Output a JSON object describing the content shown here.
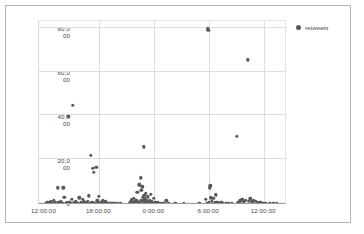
{
  "legend": {
    "position": "right",
    "series_label": "retweets",
    "marker_color": "#585858"
  },
  "axes": {
    "y_ticks": [
      {
        "value": 80000,
        "line1": "80,0",
        "line2": "00"
      },
      {
        "value": 60000,
        "line1": "60,0",
        "line2": "00"
      },
      {
        "value": 40000,
        "line1": "40,0",
        "line2": "00"
      },
      {
        "value": 20000,
        "line1": "20,0",
        "line2": "00"
      },
      {
        "value": 0,
        "line1": "0",
        "line2": ""
      }
    ],
    "x_ticks": [
      {
        "label": "12:00:00",
        "hours": 0
      },
      {
        "label": "18:00:00",
        "hours": 6
      },
      {
        "label": "0:00:00",
        "hours": 12
      },
      {
        "label": "6:00:00",
        "hours": 18
      },
      {
        "label": "12:00:00",
        "hours": 24
      }
    ]
  },
  "chart_data": {
    "type": "scatter",
    "title": "",
    "xlabel": "",
    "ylabel": "",
    "xlim": [
      -0.6,
      26.5
    ],
    "ylim": [
      0,
      84000
    ],
    "grid": true,
    "legend_position": "right",
    "series": [
      {
        "name": "retweets",
        "color": "#585858",
        "points": [
          [
            0.15,
            700
          ],
          [
            0.3,
            900
          ],
          [
            0.45,
            1200
          ],
          [
            0.55,
            600
          ],
          [
            0.7,
            1500
          ],
          [
            0.85,
            800
          ],
          [
            0.95,
            500
          ],
          [
            1.05,
            2000
          ],
          [
            1.15,
            1100
          ],
          [
            1.3,
            700
          ],
          [
            1.45,
            7800
          ],
          [
            1.5,
            900
          ],
          [
            1.65,
            600
          ],
          [
            1.8,
            1400
          ],
          [
            1.95,
            800
          ],
          [
            2.05,
            7800
          ],
          [
            2.15,
            3400
          ],
          [
            2.3,
            600
          ],
          [
            2.45,
            900
          ],
          [
            2.6,
            40500
          ],
          [
            2.7,
            1200
          ],
          [
            2.85,
            700
          ],
          [
            3.0,
            2600
          ],
          [
            3.1,
            45500
          ],
          [
            3.25,
            900
          ],
          [
            3.4,
            1600
          ],
          [
            3.5,
            600
          ],
          [
            3.65,
            800
          ],
          [
            3.8,
            3200
          ],
          [
            3.95,
            1100
          ],
          [
            4.05,
            700
          ],
          [
            4.2,
            2400
          ],
          [
            4.3,
            1300
          ],
          [
            4.45,
            900
          ],
          [
            4.55,
            600
          ],
          [
            4.7,
            1500
          ],
          [
            4.85,
            4200
          ],
          [
            4.95,
            800
          ],
          [
            5.05,
            22600
          ],
          [
            5.15,
            1200
          ],
          [
            5.25,
            16600
          ],
          [
            5.3,
            900
          ],
          [
            5.4,
            14800
          ],
          [
            5.5,
            700
          ],
          [
            5.65,
            17200
          ],
          [
            5.75,
            1900
          ],
          [
            5.85,
            1100
          ],
          [
            5.95,
            3800
          ],
          [
            6.05,
            700
          ],
          [
            6.2,
            900
          ],
          [
            6.35,
            2200
          ],
          [
            6.5,
            600
          ],
          [
            6.65,
            1300
          ],
          [
            6.8,
            800
          ],
          [
            6.95,
            500
          ],
          [
            7.1,
            700
          ],
          [
            7.3,
            400
          ],
          [
            7.5,
            600
          ],
          [
            7.7,
            450
          ],
          [
            7.9,
            500
          ],
          [
            8.1,
            350
          ],
          [
            8.3,
            400
          ],
          [
            9.3,
            900
          ],
          [
            9.45,
            1700
          ],
          [
            9.55,
            2300
          ],
          [
            9.65,
            1100
          ],
          [
            9.75,
            3100
          ],
          [
            9.85,
            1400
          ],
          [
            9.95,
            800
          ],
          [
            10.05,
            2000
          ],
          [
            10.15,
            5600
          ],
          [
            10.25,
            1200
          ],
          [
            10.35,
            9200
          ],
          [
            10.4,
            700
          ],
          [
            10.5,
            12400
          ],
          [
            10.55,
            2100
          ],
          [
            10.6,
            6500
          ],
          [
            10.65,
            1500
          ],
          [
            10.7,
            8200
          ],
          [
            10.75,
            3300
          ],
          [
            10.8,
            1900
          ],
          [
            10.85,
            26400
          ],
          [
            10.9,
            4400
          ],
          [
            10.95,
            2700
          ],
          [
            11.0,
            1100
          ],
          [
            11.1,
            5200
          ],
          [
            11.2,
            1800
          ],
          [
            11.3,
            3600
          ],
          [
            11.4,
            900
          ],
          [
            11.5,
            2200
          ],
          [
            11.6,
            4800
          ],
          [
            11.7,
            1300
          ],
          [
            11.8,
            700
          ],
          [
            11.95,
            2900
          ],
          [
            12.1,
            1000
          ],
          [
            12.25,
            600
          ],
          [
            12.4,
            900
          ],
          [
            12.6,
            500
          ],
          [
            12.8,
            700
          ],
          [
            13.0,
            450
          ],
          [
            13.3,
            1800
          ],
          [
            13.6,
            400
          ],
          [
            13.9,
            350
          ],
          [
            14.3,
            500
          ],
          [
            14.7,
            300
          ],
          [
            15.2,
            400
          ],
          [
            15.8,
            350
          ],
          [
            16.3,
            300
          ],
          [
            16.9,
            400
          ],
          [
            17.6,
            2600
          ],
          [
            17.75,
            800
          ],
          [
            17.85,
            80300
          ],
          [
            17.9,
            79600
          ],
          [
            17.95,
            1200
          ],
          [
            18.05,
            7800
          ],
          [
            18.1,
            8600
          ],
          [
            18.2,
            3200
          ],
          [
            18.3,
            1500
          ],
          [
            18.45,
            2900
          ],
          [
            18.6,
            900
          ],
          [
            18.75,
            4600
          ],
          [
            18.9,
            1200
          ],
          [
            19.05,
            700
          ],
          [
            19.3,
            1100
          ],
          [
            19.5,
            600
          ],
          [
            19.8,
            800
          ],
          [
            20.1,
            450
          ],
          [
            20.5,
            600
          ],
          [
            21.0,
            31200
          ],
          [
            21.2,
            1100
          ],
          [
            21.4,
            1900
          ],
          [
            21.6,
            2600
          ],
          [
            21.8,
            1400
          ],
          [
            22.0,
            2200
          ],
          [
            22.2,
            66200
          ],
          [
            22.3,
            1700
          ],
          [
            22.5,
            2800
          ],
          [
            22.7,
            1300
          ],
          [
            22.9,
            2000
          ],
          [
            23.1,
            1500
          ],
          [
            23.3,
            900
          ],
          [
            23.6,
            1200
          ],
          [
            23.9,
            700
          ],
          [
            24.2,
            500
          ],
          [
            24.6,
            800
          ],
          [
            25.0,
            400
          ],
          [
            25.4,
            600
          ],
          [
            25.9,
            350
          ]
        ]
      }
    ]
  }
}
